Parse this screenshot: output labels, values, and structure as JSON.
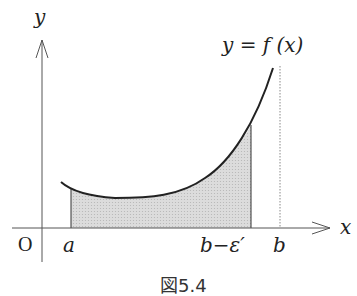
{
  "figure": {
    "caption": "図5.4",
    "curve_label": "y = f (x)",
    "axes": {
      "x_label": "x",
      "y_label": "y",
      "origin_label": "O"
    },
    "x_ticks": [
      {
        "label": "a",
        "role": "lower limit"
      },
      {
        "label": "b−ε′",
        "role": "truncated upper limit"
      },
      {
        "label": "b",
        "role": "upper limit (dotted asymptote)"
      }
    ],
    "shaded_region": "area under y=f(x) from a to b−ε′",
    "colors": {
      "curve": "#222222",
      "axis": "#555555",
      "shade": "#d4d4d4",
      "dotted_line": "#888888"
    }
  }
}
